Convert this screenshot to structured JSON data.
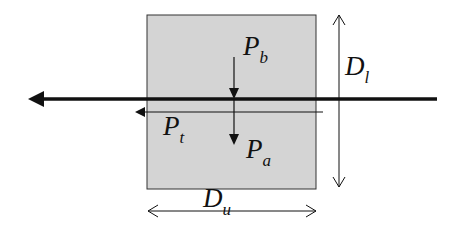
{
  "diagram": {
    "box": {
      "fill": "#d4d4d4",
      "stroke": "#333333"
    },
    "labels": {
      "pb": {
        "main": "P",
        "sub": "b"
      },
      "pa": {
        "main": "P",
        "sub": "a"
      },
      "pt": {
        "main": "P",
        "sub": "t"
      },
      "dl": {
        "main": "D",
        "sub": "l"
      },
      "du": {
        "main": "D",
        "sub": "u"
      }
    }
  }
}
